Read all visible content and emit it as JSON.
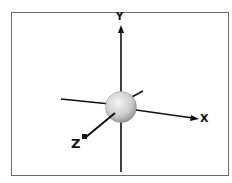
{
  "diagram": {
    "axes": {
      "x_label": "X",
      "y_label": "Y",
      "z_label": "Z"
    },
    "center_object": "sphere",
    "colors": {
      "axis": "#111111",
      "frame": "#6a6a6a",
      "sphere_light": "#f2f2f2",
      "sphere_dark": "#9a9a9a"
    }
  }
}
